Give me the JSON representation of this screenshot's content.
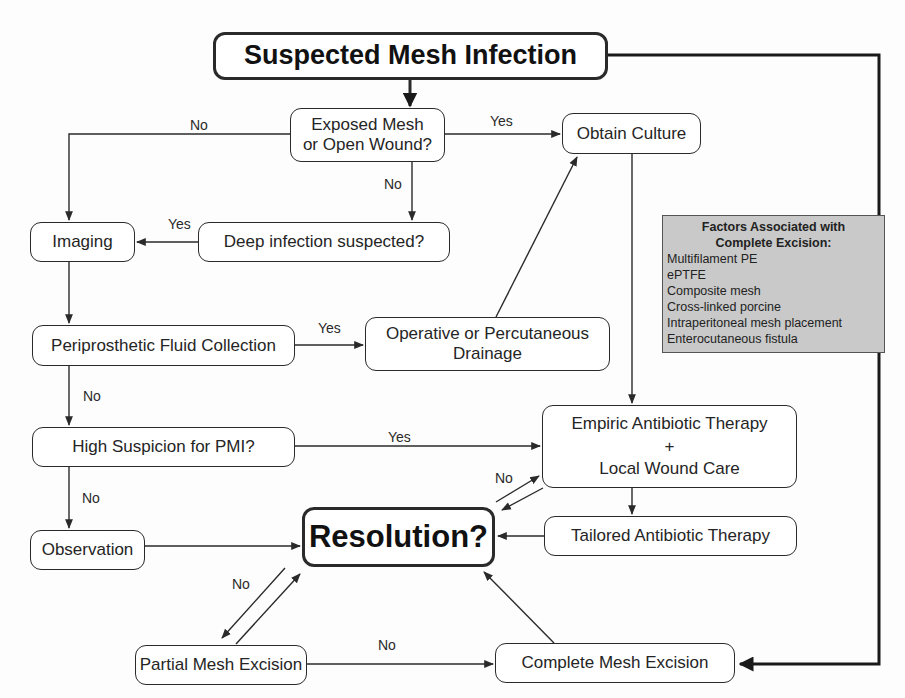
{
  "diagram": {
    "title": "Suspected Mesh Infection",
    "nodes": {
      "exposed_mesh": {
        "line1": "Exposed Mesh",
        "line2": "or Open Wound?"
      },
      "obtain_culture": "Obtain Culture",
      "imaging": "Imaging",
      "deep_infection": "Deep infection suspected?",
      "periprosthetic": "Periprosthetic Fluid Collection",
      "drainage": {
        "line1": "Operative or Percutaneous",
        "line2": "Drainage"
      },
      "high_suspicion": "High Suspicion for PMI?",
      "empiric": {
        "line1": "Empiric Antibiotic Therapy",
        "line2": "+",
        "line3": "Local Wound Care"
      },
      "observation": "Observation",
      "resolution": "Resolution?",
      "tailored": "Tailored Antibiotic Therapy",
      "partial_excision": "Partial Mesh Excision",
      "complete_excision": "Complete Mesh Excision"
    },
    "edge_labels": {
      "exposed_no_left": "No",
      "exposed_yes": "Yes",
      "exposed_no_down": "No",
      "deep_yes": "Yes",
      "fluid_yes": "Yes",
      "fluid_no": "No",
      "suspicion_yes": "Yes",
      "suspicion_no": "No",
      "resolution_no_empiric": "No",
      "resolution_no_partial": "No",
      "partial_no_complete": "No"
    },
    "factors_box": {
      "heading_line1": "Factors Associated with",
      "heading_line2": "Complete Excision:",
      "items": [
        "Multifilament PE",
        "ePTFE",
        "Composite mesh",
        "Cross-linked porcine",
        "Intraperitoneal mesh placement",
        "Enterocutaneous fistula"
      ]
    },
    "colors": {
      "line": "#2a2a2a",
      "factors_fill": "#c9c9c9",
      "background": "#fdfdfd"
    }
  }
}
